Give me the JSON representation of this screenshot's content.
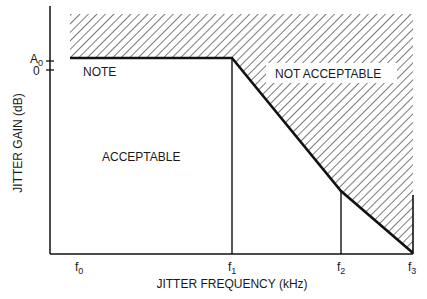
{
  "diagram": {
    "type": "jitter tolerance mask",
    "y_axis": {
      "title": "JITTER GAIN (dB)",
      "ticks": [
        {
          "label": "A",
          "sub": "0"
        },
        {
          "label": "0",
          "sub": ""
        }
      ]
    },
    "x_axis": {
      "title": "JITTER FREQUENCY (kHz)",
      "ticks": [
        {
          "label": "f",
          "sub": "0"
        },
        {
          "label": "f",
          "sub": "1"
        },
        {
          "label": "f",
          "sub": "2"
        },
        {
          "label": "f",
          "sub": "3"
        }
      ]
    },
    "regions": {
      "acceptable": "ACCEPTABLE",
      "not_acceptable": "NOT ACCEPTABLE",
      "note": "NOTE"
    },
    "colors": {
      "line": "#111111",
      "hatch": "#333333",
      "background": "#ffffff"
    }
  }
}
